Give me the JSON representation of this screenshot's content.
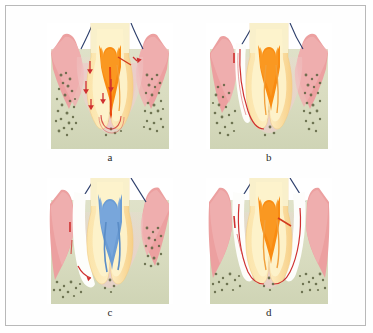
{
  "figure": {
    "type": "dental-illustration-figure",
    "panel_count": 4,
    "layout": "2x2-grid",
    "background_color": "#ffffff",
    "border_color": "#b9b9b9"
  },
  "palette": {
    "enamel": "#f7eec2",
    "enamel_light": "#fdf7d9",
    "dentin": "#fbe3a8",
    "dentin_dark": "#f7cf86",
    "pulp_orange": "#f98c12",
    "pulp_orange_dark": "#e97608",
    "pulp_blue": "#6b9cd4",
    "pulp_blue_dark": "#5a8cc6",
    "gingiva": "#eca0a0",
    "gingiva_light": "#f3c4c4",
    "pdl_pink": "#f0c5c8",
    "pdl_pink_light": "#f6dcdc",
    "bone": "#d9dcc0",
    "bone_speckle": "#5d6340",
    "lesion_red": "#cf3030",
    "adjacent_tooth_outline": "#2c3e6b",
    "defect_white": "#fdfdfb"
  },
  "panels": [
    {
      "id": "a",
      "label": "a",
      "caption_letter": "a",
      "pulp_color": "#f98c12",
      "pulp_state": "inflamed-vital",
      "description": "Primary endodontic lesion: two-rooted molar with orange inflamed pulp, lateral canal and apical radiolucency; red arrows show spread of infection from pulp to periodontium",
      "features": [
        "orange pulp chamber with pointed pulp horns",
        "pulp canals in both mesial and distal roots",
        "apical lesion at root apex",
        "lateral canal on distal root",
        "intact gingival margin on both sides",
        "red arrows indicating endodontic-to-periodontal spread"
      ],
      "arrow_count": 6,
      "defect_sides": "none"
    },
    {
      "id": "b",
      "label": "b",
      "caption_letter": "b",
      "pulp_color": "#f98c12",
      "pulp_state": "inflamed-vital",
      "description": "Primary endodontic lesion with secondary periodontal involvement: deep narrow pocket traced down the mesial root surface to the apex",
      "features": [
        "orange pulp chamber and canals",
        "narrow white periodontal pocket on the left (mesial) surface",
        "red lesion line tracking from gingival margin to apex",
        "bone loss adjacent to the mesial root",
        "gingiva receded on the left side"
      ],
      "arrow_count": 0,
      "defect_sides": "left"
    },
    {
      "id": "c",
      "label": "c",
      "caption_letter": "c",
      "pulp_color": "#6b9cd4",
      "pulp_state": "root-filled-treated",
      "description": "Primary periodontal lesion: root-filled (blue) pulp chamber with a wide deep periodontal pocket and angular bone loss on the mesial aspect",
      "features": [
        "blue root-filling material in pulp chamber and canals",
        "wide white periodontal defect on left surface",
        "angular / vertical bone loss mesially",
        "red lesion marking near the mesial apex",
        "marked gingival recession on left"
      ],
      "arrow_count": 1,
      "defect_sides": "left"
    },
    {
      "id": "d",
      "label": "d",
      "caption_letter": "d",
      "pulp_color": "#f98c12",
      "pulp_state": "inflamed-vital",
      "description": "True combined endodontic-periodontal lesion: orange inflamed pulp with deep periodontal defects on both mesial and distal surfaces coalescing with the apical lesion",
      "features": [
        "orange pulp chamber with pulp horns",
        "deep periodontal pockets on both left and right surfaces",
        "lateral canal on the distal root",
        "bilateral vertical bone loss",
        "red lesion lines on both root surfaces meeting at the furcation"
      ],
      "arrow_count": 0,
      "defect_sides": "both"
    }
  ]
}
